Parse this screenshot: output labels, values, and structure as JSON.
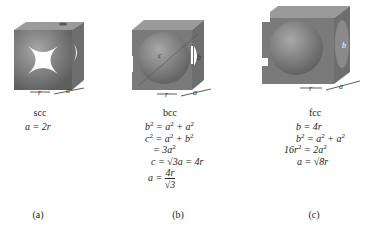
{
  "panels": [
    {
      "id": "a",
      "structure": "scc",
      "caption": "(a)",
      "dimension_labels": [
        "r",
        "a"
      ],
      "equations": [
        "a = 2r"
      ],
      "colors": {
        "cube": "#7a7a7a",
        "sphere": "#8c8c8c"
      }
    },
    {
      "id": "b",
      "structure": "bcc",
      "caption": "(b)",
      "dimension_labels": [
        "r",
        "a",
        "b",
        "c"
      ],
      "equations": [
        "b² = a² + a²",
        "c² = a² + b²",
        "= 3a²",
        "c = √3a = 4r",
        "a = 4r / √3"
      ],
      "colors": {
        "cube": "#7a7a7a",
        "sphere": "#8c8c8c"
      }
    },
    {
      "id": "c",
      "structure": "fcc",
      "caption": "(c)",
      "dimension_labels": [
        "r",
        "a",
        "b"
      ],
      "equations": [
        "b = 4r",
        "b² = a² + a²",
        "16r² = 2a²",
        "a = √8r"
      ],
      "colors": {
        "cube": "#7a7a7a",
        "sphere": "#8c8c8c"
      }
    }
  ]
}
